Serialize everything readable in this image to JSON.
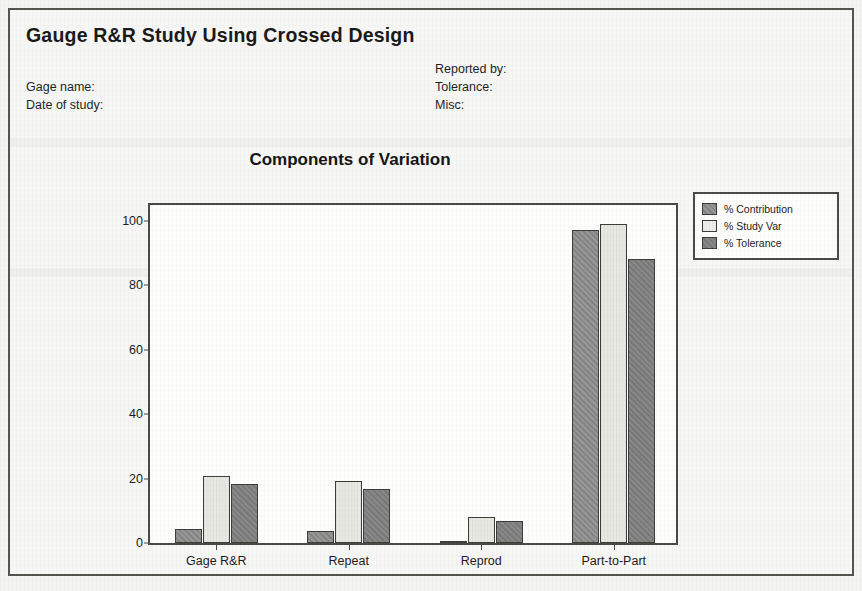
{
  "report": {
    "title": "Gauge R&R Study Using Crossed Design",
    "fields_left": [
      {
        "label": "Gage name:",
        "value": ""
      },
      {
        "label": "Date of study:",
        "value": ""
      }
    ],
    "fields_right": [
      {
        "label": "Reported by:",
        "value": ""
      },
      {
        "label": "Tolerance:",
        "value": ""
      },
      {
        "label": "Misc:",
        "value": ""
      }
    ]
  },
  "chart_data": {
    "type": "bar",
    "title": "Components of Variation",
    "xlabel": "",
    "ylabel": "",
    "ylim": [
      0,
      105
    ],
    "yticks": [
      0,
      20,
      40,
      60,
      80,
      100
    ],
    "ytick_labels": [
      "0",
      "20",
      "40",
      "60",
      "80",
      "100"
    ],
    "grid": false,
    "legend_position": "right",
    "categories": [
      "Gage R&R",
      "Repeat",
      "Reprod",
      "Part-to-Part"
    ],
    "series": [
      {
        "name": "% Contribution",
        "color": "#8c8c8c",
        "values": [
          4.3,
          3.7,
          0.6,
          96.0
        ]
      },
      {
        "name": "% Study Var",
        "color": "#e9e9e4",
        "values": [
          20.6,
          19.1,
          7.9,
          97.8
        ]
      },
      {
        "name": "% Tolerance",
        "color": "#7f7f7f",
        "values": [
          18.1,
          16.6,
          6.9,
          87.2
        ]
      }
    ]
  }
}
